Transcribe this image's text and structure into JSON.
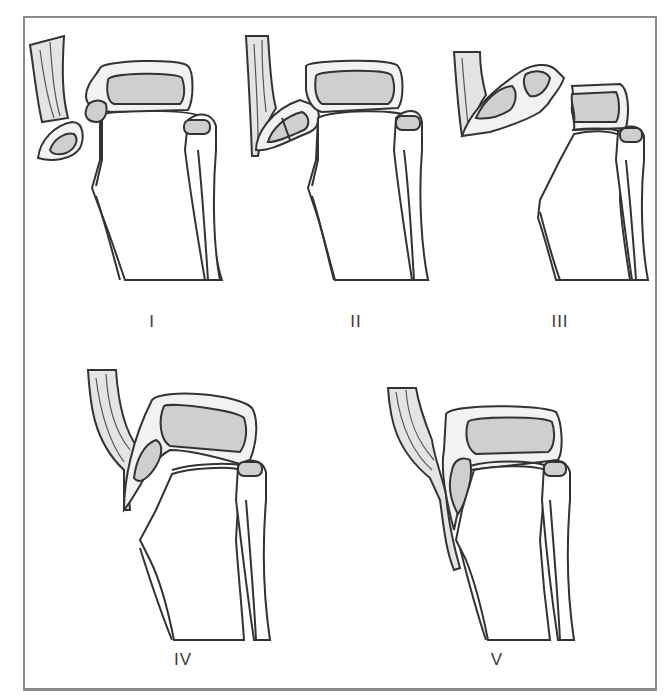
{
  "figure": {
    "type": "anatomical-diagram",
    "colors": {
      "outline": "#333333",
      "cortex": "#f2f2f2",
      "marrow": "#cfcfcf",
      "frame": "#8a8a8a",
      "background": "#ffffff"
    },
    "panels": [
      {
        "id": "I",
        "label": "I",
        "description": "Small avulsed fragment of tubercle tip with patellar tendon"
      },
      {
        "id": "II",
        "label": "II",
        "description": "Larger avulsed tubercle fragment, fracture line across fragment"
      },
      {
        "id": "III",
        "label": "III",
        "description": "Fracture extends through proximal tibial epiphysis into joint, fragment displaced"
      },
      {
        "id": "IV",
        "label": "IV",
        "description": "Fracture through entire proximal tibial physis, epiphysis displaced posteriorly"
      },
      {
        "id": "V",
        "label": "V",
        "description": "Patellar tendon periosteal sleeve avulsion"
      }
    ]
  }
}
